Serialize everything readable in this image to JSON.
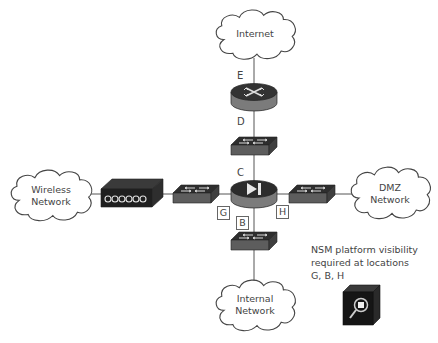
{
  "diagram": {
    "clouds": {
      "internet": "Internet",
      "wireless": [
        "Wireless",
        "Network"
      ],
      "dmz": [
        "DMZ",
        "Network"
      ],
      "internal": [
        "Internal",
        "Network"
      ]
    },
    "devices": {
      "router": "router-icon",
      "switch_top": "switch-icon",
      "firewall": "firewall-icon",
      "switch_left": "switch-icon",
      "switch_right": "switch-icon",
      "switch_bottom": "switch-icon",
      "wireless_ap": "wireless-access-point-icon",
      "nsm_sensor": "nsm-sensor-icon"
    },
    "location_labels": {
      "E": "E",
      "D": "D",
      "C": "C"
    },
    "boxed_labels": {
      "G": "G",
      "B": "B",
      "H": "H"
    },
    "note": {
      "line1": "NSM platform visibility",
      "line2": "required at locations",
      "line3": "G, B, H"
    },
    "colors": {
      "device_top": "#3a3a3a",
      "device_side": "#7a7a7a",
      "line": "#555555",
      "text": "#444444"
    }
  }
}
